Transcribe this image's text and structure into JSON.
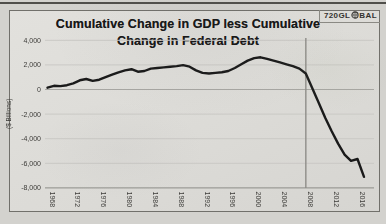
{
  "page": {
    "background": "#d3d2ce"
  },
  "logo": {
    "text_left": "720GL",
    "text_right": "BAL",
    "globe_icon": "globe-icon",
    "color": "#33322f"
  },
  "chart_data": {
    "type": "line",
    "title_line1": "Cumulative Change in GDP less Cumulative",
    "title_line2": "Change in Federal Debt",
    "ylabel": "($ Billions)",
    "x": [
      1968,
      1969,
      1970,
      1971,
      1972,
      1973,
      1974,
      1975,
      1976,
      1977,
      1978,
      1979,
      1980,
      1981,
      1982,
      1983,
      1984,
      1985,
      1986,
      1987,
      1988,
      1989,
      1990,
      1991,
      1992,
      1993,
      1994,
      1995,
      1996,
      1997,
      1998,
      1999,
      2000,
      2001,
      2002,
      2003,
      2004,
      2005,
      2006,
      2007,
      2008,
      2009,
      2010,
      2011,
      2012,
      2013,
      2014,
      2015,
      2016,
      2017
    ],
    "values": [
      150,
      300,
      280,
      350,
      500,
      750,
      850,
      700,
      800,
      1000,
      1200,
      1400,
      1550,
      1650,
      1450,
      1500,
      1700,
      1750,
      1800,
      1850,
      1900,
      1980,
      1850,
      1550,
      1350,
      1300,
      1350,
      1400,
      1500,
      1750,
      2050,
      2350,
      2550,
      2620,
      2500,
      2350,
      2200,
      2050,
      1900,
      1700,
      1300,
      100,
      -1100,
      -2300,
      -3400,
      -4400,
      -5300,
      -5800,
      -5650,
      -7100
    ],
    "x_ticks": [
      1968,
      1972,
      1976,
      1980,
      1984,
      1988,
      1992,
      1996,
      2000,
      2004,
      2008,
      2012,
      2016
    ],
    "y_ticks": [
      "4,000",
      "2,000",
      "0",
      "-2,000",
      "-4,000",
      "-6,000",
      "-8,000"
    ],
    "y_tick_values": [
      4000,
      2000,
      0,
      -2000,
      -4000,
      -6000,
      -8000
    ],
    "ylim": [
      -8000,
      4000
    ],
    "xlim": [
      1968,
      2017
    ],
    "annotation_vline_x": 2008,
    "grid": "horizontal-faint",
    "legend": "none",
    "line_color": "#1a1a1a",
    "vline_color": "#8e8d89",
    "zero_line_color": "#a7a6a2",
    "axis_line_color": "#8d8c88",
    "grid_color": "#cac9c5"
  }
}
